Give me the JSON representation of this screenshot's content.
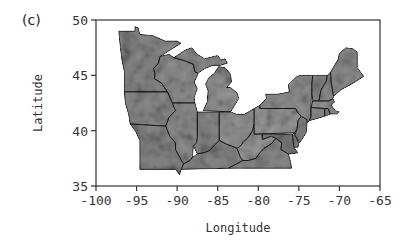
{
  "figure": {
    "panel_label": "(c)",
    "x_axis": {
      "title": "Longitude",
      "range": [
        -100,
        -65
      ],
      "ticks": [
        -100,
        -95,
        -90,
        -85,
        -80,
        -75,
        -70,
        -65
      ],
      "tick_labels": [
        "-100",
        "-95",
        "-90",
        "-85",
        "-80",
        "-75",
        "-70",
        "-65"
      ]
    },
    "y_axis": {
      "title": "Latitude",
      "range": [
        35,
        50
      ],
      "ticks": [
        35,
        40,
        45,
        50
      ],
      "tick_labels": [
        "35",
        "40",
        "45",
        "50"
      ]
    },
    "map": {
      "region": "Northeastern and Midwestern United States",
      "fill_style": "grayscale gradient raster",
      "colors": {
        "land_dark": "#6e6e6e",
        "land_mid": "#8c8c8c",
        "land_light": "#c8c8c8",
        "border": "#1a1a1a",
        "water": "#ffffff"
      },
      "states": [
        {
          "name": "Minnesota",
          "shade": "#8a8a8a"
        },
        {
          "name": "Wisconsin",
          "shade": "#939393"
        },
        {
          "name": "Michigan Upper",
          "shade": "#8f8f8f"
        },
        {
          "name": "Michigan Lower",
          "shade": "#969696"
        },
        {
          "name": "Iowa",
          "shade": "#8c8c8c"
        },
        {
          "name": "Missouri",
          "shade": "#878787"
        },
        {
          "name": "Illinois",
          "shade": "#8e8e8e"
        },
        {
          "name": "Indiana",
          "shade": "#8b8b8b"
        },
        {
          "name": "Ohio",
          "shade": "#979797"
        },
        {
          "name": "Kentucky",
          "shade": "#8a8a8a"
        },
        {
          "name": "West Virginia",
          "shade": "#9b9b9b"
        },
        {
          "name": "Virginia",
          "shade": "#8d8d8d"
        },
        {
          "name": "Pennsylvania",
          "shade": "#9a9a9a"
        },
        {
          "name": "New York",
          "shade": "#939393"
        },
        {
          "name": "Maryland",
          "shade": "#7c7c7c"
        },
        {
          "name": "Delaware",
          "shade": "#888888"
        },
        {
          "name": "New Jersey",
          "shade": "#8a8a8a"
        },
        {
          "name": "Connecticut",
          "shade": "#909090"
        },
        {
          "name": "Rhode Island",
          "shade": "#8c8c8c"
        },
        {
          "name": "Massachusetts",
          "shade": "#929292"
        },
        {
          "name": "Vermont",
          "shade": "#8e8e8e"
        },
        {
          "name": "New Hampshire",
          "shade": "#8b8b8b"
        },
        {
          "name": "Maine",
          "shade": "#8f8f8f"
        }
      ]
    }
  }
}
